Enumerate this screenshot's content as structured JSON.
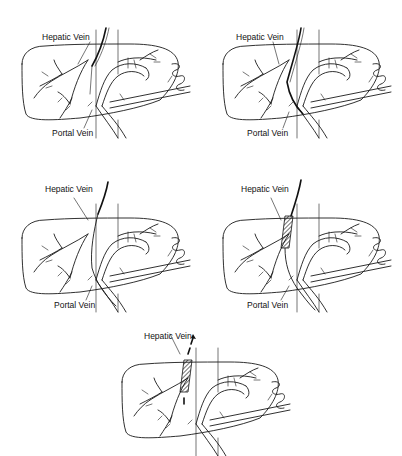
{
  "figure": {
    "panels": [
      {
        "id": "a",
        "labels": {
          "hepatic": "Hepatic Vein",
          "portal": "Portal Vein"
        },
        "stage": "needle-tract"
      },
      {
        "id": "b",
        "labels": {
          "hepatic": "Hepatic Vein",
          "portal": "Portal Vein"
        },
        "stage": "guidewire-through"
      },
      {
        "id": "c",
        "labels": {
          "hepatic": "Hepatic Vein",
          "portal": "Portal Vein"
        },
        "stage": "wire-in-portal"
      },
      {
        "id": "d",
        "labels": {
          "hepatic": "Hepatic Vein",
          "portal": "Portal Vein"
        },
        "stage": "stent-placed"
      },
      {
        "id": "e",
        "labels": {
          "hepatic": "Hepatic Vein"
        },
        "stage": "stent-with-flow-arrows"
      }
    ]
  }
}
